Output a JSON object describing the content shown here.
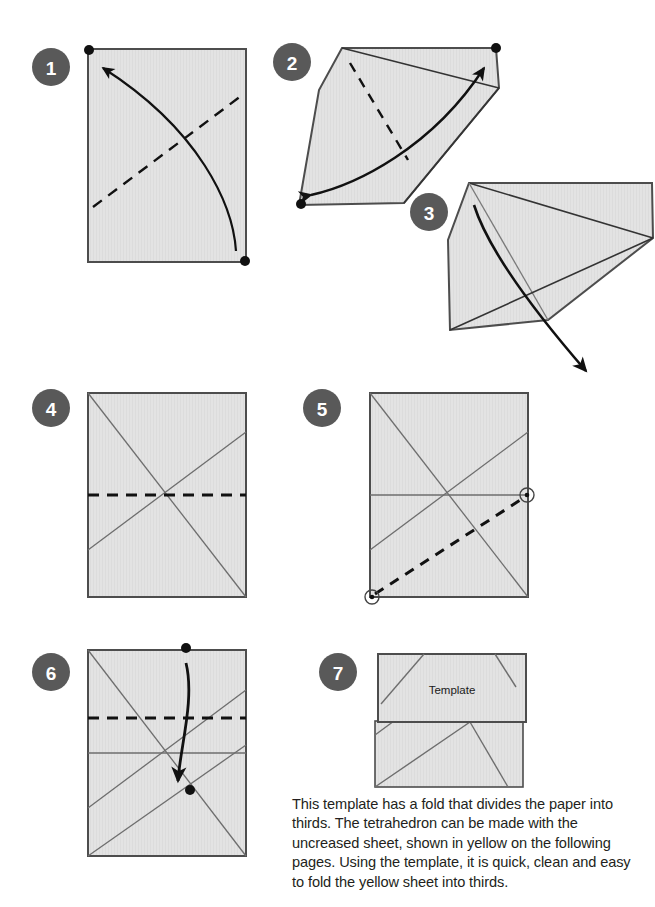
{
  "page": {
    "width": 655,
    "height": 907,
    "background": "#ffffff"
  },
  "colors": {
    "paper_fill": "#e3e3e3",
    "paper_fill_alt": "#dedede",
    "paper_edge": "#4d4d4d",
    "crease_line": "#6e6e6e",
    "fold_dash": "#111111",
    "arrow": "#111111",
    "badge_bg": "#595959",
    "badge_text": "#ffffff",
    "caption_text": "#231f20"
  },
  "steps": [
    {
      "number": "1",
      "name": "step-1",
      "badge_cx": 51,
      "badge_cy": 67
    },
    {
      "number": "2",
      "name": "step-2",
      "badge_cx": 292,
      "badge_cy": 62
    },
    {
      "number": "3",
      "name": "step-3",
      "badge_cx": 429,
      "badge_cy": 212
    },
    {
      "number": "4",
      "name": "step-4",
      "badge_cx": 51,
      "badge_cy": 408
    },
    {
      "number": "5",
      "name": "step-5",
      "badge_cx": 322,
      "badge_cy": 408
    },
    {
      "number": "6",
      "name": "step-6",
      "badge_cx": 51,
      "badge_cy": 672
    },
    {
      "number": "7",
      "name": "step-7",
      "badge_cx": 338,
      "badge_cy": 672
    }
  ],
  "labels": {
    "template": "Template"
  },
  "caption": {
    "text": "This template has a fold that divides the paper into thirds. The tetrahedron can be made with the uncreased sheet, shown in yellow on the following pages. Using the template, it is quick, clean and easy to fold the yellow sheet into thirds."
  },
  "diagram_legend": {
    "dashed_line_meaning": "valley fold line",
    "solid_thin_line_meaning": "existing crease",
    "curved_arrow_meaning": "fold direction",
    "black_dot_meaning": "corner reference point",
    "circled_dot_meaning": "alignment reference point"
  }
}
